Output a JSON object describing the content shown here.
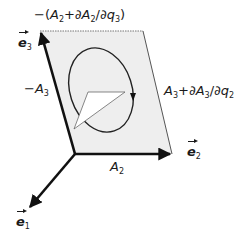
{
  "diagram": {
    "type": "vector-calculus-circulation-element",
    "colors": {
      "plane_fill": "#eeeeee",
      "axis": "#111111",
      "curve": "#222222",
      "triangle_fill": "#ffffff",
      "text": "#1a1a1a"
    },
    "axes": {
      "e1": {
        "symbol": "e",
        "index": "1"
      },
      "e2": {
        "symbol": "e",
        "index": "2"
      },
      "e3": {
        "symbol": "e",
        "index": "3"
      }
    },
    "edge_labels": {
      "bottom": {
        "prefix": "",
        "main": "A",
        "main_index": "2",
        "suffix": ""
      },
      "left": {
        "prefix": "−",
        "main": "A",
        "main_index": "3",
        "suffix": ""
      },
      "top": {
        "text_prefix": "−(",
        "a": "A",
        "a_index": "2",
        "plus": "+∂",
        "b": "A",
        "b_index": "2",
        "slash": "/∂",
        "q": "q",
        "q_index": "3",
        "close": ")"
      },
      "right": {
        "a": "A",
        "a_index": "3",
        "plus": "+∂",
        "b": "A",
        "b_index": "3",
        "slash": "/∂",
        "q": "q",
        "q_index": "2"
      }
    },
    "elements": [
      "parallelogram surface element",
      "closed oriented loop (ellipse) with arrow",
      "white normal wedge"
    ]
  }
}
